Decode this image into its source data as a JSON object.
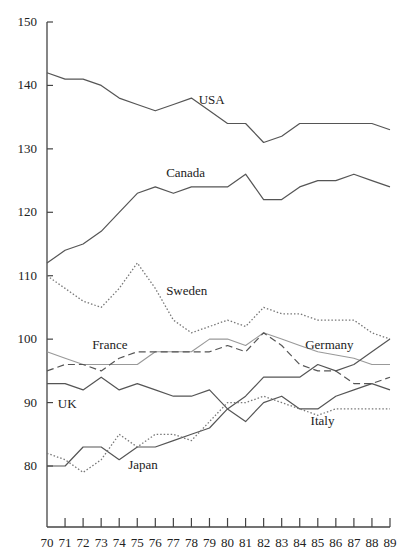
{
  "chart_data": {
    "type": "line",
    "title": "",
    "xlabel": "",
    "ylabel": "",
    "x": [
      70,
      71,
      72,
      73,
      74,
      75,
      76,
      77,
      78,
      79,
      80,
      81,
      82,
      83,
      84,
      85,
      86,
      87,
      88,
      89
    ],
    "xticks": [
      "70",
      "71",
      "72",
      "73",
      "74",
      "75",
      "76",
      "77",
      "78",
      "79",
      "80",
      "81",
      "82",
      "83",
      "84",
      "85",
      "86",
      "87",
      "88",
      "89"
    ],
    "yticks": [
      "150",
      "140",
      "130",
      "120",
      "110",
      "100",
      "90",
      "80"
    ],
    "ylim": [
      70,
      150
    ],
    "xlim": [
      70,
      89
    ],
    "grid": false,
    "legend_position": "inline labels",
    "series": [
      {
        "name": "USA",
        "style": "solid",
        "color": "#555555",
        "label_x": 78.4,
        "label_y": 137,
        "values": [
          142,
          141,
          141,
          140,
          138,
          137,
          136,
          137,
          138,
          136,
          134,
          134,
          131,
          132,
          134,
          134,
          134,
          134,
          134,
          133
        ]
      },
      {
        "name": "Canada",
        "style": "solid",
        "color": "#555555",
        "label_x": 76.6,
        "label_y": 125.5,
        "values": [
          112,
          114,
          115,
          117,
          120,
          123,
          124,
          123,
          124,
          124,
          124,
          126,
          122,
          122,
          124,
          125,
          125,
          126,
          125,
          124
        ]
      },
      {
        "name": "Sweden",
        "style": "dotted",
        "color": "#777777",
        "label_x": 76.6,
        "label_y": 107,
        "values": [
          110,
          108,
          106,
          105,
          108,
          112,
          108,
          103,
          101,
          102,
          103,
          102,
          105,
          104,
          104,
          103,
          103,
          103,
          101,
          100
        ]
      },
      {
        "name": "Germany",
        "style": "solid-light",
        "color": "#999999",
        "label_x": 84.3,
        "label_y": 98.5,
        "values": [
          98,
          97,
          96,
          96,
          96,
          96,
          98,
          98,
          98,
          100,
          100,
          99,
          101,
          100,
          99,
          98,
          97.5,
          97,
          96,
          96
        ]
      },
      {
        "name": "France",
        "style": "dashed",
        "color": "#555555",
        "label_x": 72.5,
        "label_y": 98.5,
        "values": [
          95,
          96,
          96,
          95,
          97,
          98,
          98,
          98,
          98,
          98,
          99,
          98,
          101,
          99,
          96,
          95,
          95,
          93,
          93,
          94
        ]
      },
      {
        "name": "UK",
        "style": "solid",
        "color": "#555555",
        "label_x": 70.6,
        "label_y": 89.2,
        "values": [
          93,
          93,
          92,
          94,
          92,
          93,
          92,
          91,
          91,
          92,
          89,
          87,
          90,
          91,
          89,
          89,
          91,
          92,
          93,
          92
        ]
      },
      {
        "name": "Japan",
        "style": "solid",
        "color": "#555555",
        "label_x": 74.5,
        "label_y": 79.6,
        "values": [
          80,
          80,
          83,
          83,
          81,
          83,
          83,
          84,
          85,
          86,
          89,
          91,
          94,
          94,
          94,
          96,
          95,
          96,
          98,
          100
        ]
      },
      {
        "name": "Italy",
        "style": "dotted",
        "color": "#777777",
        "label_x": 84.6,
        "label_y": 86.5,
        "values": [
          82,
          81,
          79,
          81,
          85,
          83,
          85,
          85,
          84,
          87,
          90,
          90,
          91,
          90,
          89,
          88,
          89,
          89,
          89,
          89
        ]
      }
    ]
  }
}
